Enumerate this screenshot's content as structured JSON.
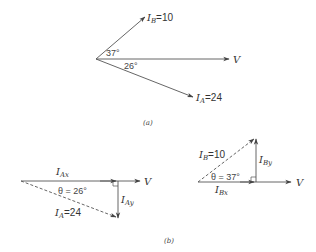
{
  "figure_a": {
    "caption": "(a)",
    "vectors": [
      {
        "name": "I_B",
        "label": "I",
        "sub": "B",
        "value_text": "=10",
        "magnitude": 10,
        "angle_deg": 37
      },
      {
        "name": "V",
        "label": "V",
        "angle_deg": 0
      },
      {
        "name": "I_A",
        "label": "I",
        "sub": "A",
        "value_text": "=24",
        "magnitude": 24,
        "angle_deg": -26
      }
    ],
    "angle_labels": {
      "upper": "37°",
      "lower": "26°"
    }
  },
  "figure_b": {
    "caption": "(b)",
    "left": {
      "hyp_label": "I",
      "hyp_sub": "A",
      "hyp_value": "=24",
      "x_comp_label": "I",
      "x_comp_sub": "Ax",
      "y_comp_label": "I",
      "y_comp_sub": "Ay",
      "theta": "θ = 26°",
      "ref_label": "V"
    },
    "right": {
      "hyp_label": "I",
      "hyp_sub": "B",
      "hyp_value": "=10",
      "x_comp_label": "I",
      "x_comp_sub": "Bx",
      "y_comp_label": "I",
      "y_comp_sub": "By",
      "theta": "θ = 37°",
      "ref_label": "V"
    }
  },
  "colors": {
    "line": "#444444",
    "text": "#333333",
    "background": "#ffffff"
  }
}
